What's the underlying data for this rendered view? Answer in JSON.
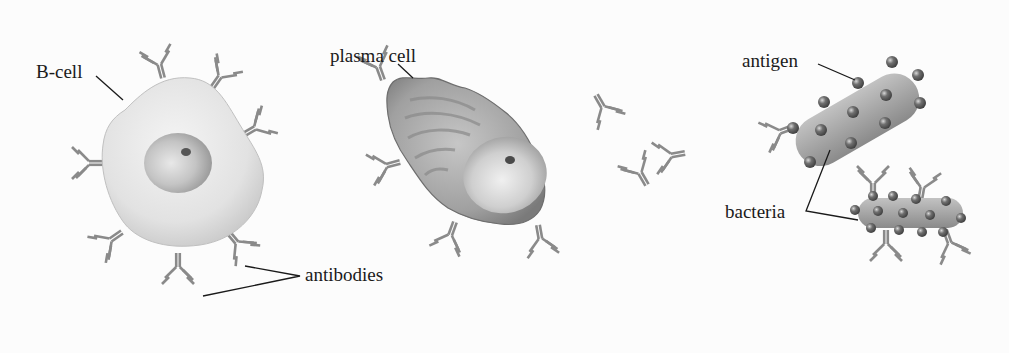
{
  "diagram": {
    "type": "biology-illustration",
    "labels": {
      "b_cell": "B-cell",
      "plasma_cell": "plasma cell",
      "antibodies": "antibodies",
      "antigen": "antigen",
      "bacteria": "bacteria"
    },
    "colors": {
      "background": "#fcfcfc",
      "antibody": "#8a8a8a",
      "b_cell_body": "#e6e6e6",
      "plasma_cell_body": "#9a9a9a",
      "bacteria_body": "#a8a8a8",
      "antigen": "#5a5a5a",
      "label_text": "#1a1a1a"
    }
  }
}
